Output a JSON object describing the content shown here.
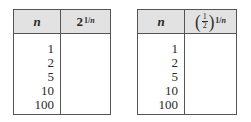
{
  "tables": [
    {
      "header": {
        "n_label": "n",
        "func_base": "2",
        "func_exp_num": "1/",
        "func_exp_var": "n"
      },
      "n_values": [
        "1",
        "2",
        "5",
        "10",
        "100"
      ],
      "f_values": [
        "",
        "",
        "",
        "",
        ""
      ]
    },
    {
      "header": {
        "n_label": "n",
        "func_frac_num": "1",
        "func_frac_den": "2",
        "func_exp_num": "1/",
        "func_exp_var": "n"
      },
      "n_values": [
        "1",
        "2",
        "5",
        "10",
        "100"
      ],
      "f_values": [
        "",
        "",
        "",
        "",
        ""
      ]
    }
  ],
  "colors": {
    "header_bg": "#e2e2e2",
    "border": "#555555",
    "text": "#2a2a2a"
  }
}
